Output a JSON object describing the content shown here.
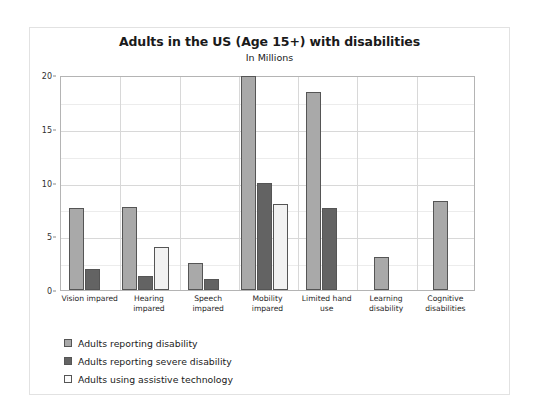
{
  "chart_data": {
    "type": "bar",
    "title": "Adults in the US (Age 15+) with disabilities",
    "subtitle": "In Millions",
    "xlabel": "",
    "ylabel": "",
    "ylim": [
      0,
      20
    ],
    "yticks": [
      0,
      5,
      10,
      15,
      20
    ],
    "gridlines": [
      2.5,
      5,
      7.5,
      10,
      12.5,
      15,
      17.5,
      20
    ],
    "grid": true,
    "legend_position": "bottom-left",
    "categories": [
      "Vision impared",
      "Hearing impared",
      "Speech impared",
      "Mobility impared",
      "Limited hand use",
      "Learning disability",
      "Cognitive disabilities"
    ],
    "series": [
      {
        "name": "Adults reporting disability",
        "color": "#a9a9a9",
        "values": [
          7.6,
          7.7,
          2.5,
          19.9,
          18.4,
          3.1,
          8.3
        ]
      },
      {
        "name": "Adults reporting severe disability",
        "color": "#636363",
        "values": [
          2.0,
          1.3,
          1.0,
          10.0,
          7.6,
          null,
          null
        ]
      },
      {
        "name": "Adults using assistive technology",
        "color": "#f2f2f2",
        "values": [
          null,
          4.0,
          null,
          8.0,
          null,
          null,
          null
        ]
      }
    ]
  },
  "legend": {
    "items": [
      {
        "label": "Adults reporting disability",
        "swatch": "s0"
      },
      {
        "label": "Adults reporting severe disability",
        "swatch": "s1"
      },
      {
        "label": "Adults using assistive technology",
        "swatch": "s2"
      }
    ]
  }
}
